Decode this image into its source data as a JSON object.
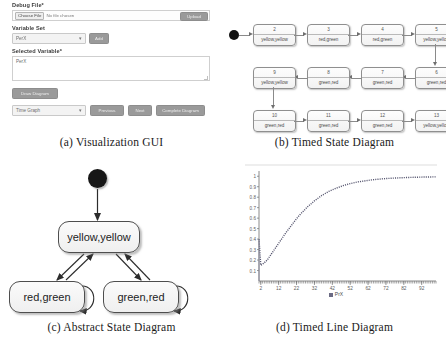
{
  "panel_a": {
    "caption": "(a) Visualization GUI",
    "debug_file": {
      "label": "Debug File*",
      "choose_button": "Choose File",
      "file_status": "No file chosen",
      "upload_button": "Upload"
    },
    "variable_set": {
      "label": "Variable Set",
      "selected_option": "PerX",
      "add_button": "Add"
    },
    "selected_variable": {
      "label": "Selected Variable*",
      "value": "PerX"
    },
    "draw_button": "Draw Diagram",
    "footer": {
      "diagram_type": "Time Graph",
      "previous_button": "Previous",
      "next_button": "Next",
      "complete_button": "Complete Diagram"
    }
  },
  "panel_b": {
    "caption": "(b) Timed State Diagram",
    "initial_node": "initial-state",
    "states": [
      {
        "id": "2",
        "label": "yellow,yellow"
      },
      {
        "id": "3",
        "label": "red,green"
      },
      {
        "id": "4",
        "label": "red,green"
      },
      {
        "id": "5",
        "label": "yellow,yellow"
      },
      {
        "id": "9",
        "label": "yellow,yellow"
      },
      {
        "id": "8",
        "label": "green,red"
      },
      {
        "id": "7",
        "label": "green,red"
      },
      {
        "id": "6",
        "label": "green,red"
      },
      {
        "id": "10",
        "label": "green,red"
      },
      {
        "id": "11",
        "label": "green,red"
      },
      {
        "id": "12",
        "label": "green,red"
      },
      {
        "id": "13",
        "label": "yellow,yellow"
      }
    ]
  },
  "panel_c": {
    "caption": "(c) Abstract State Diagram",
    "initial_node": "initial-state",
    "states": [
      {
        "label": "yellow,yellow"
      },
      {
        "label": "red,green"
      },
      {
        "label": "green,red"
      }
    ]
  },
  "panel_d": {
    "caption": "(d) Timed Line Diagram",
    "chart_data": {
      "type": "line",
      "title": "",
      "xlabel": "",
      "ylabel": "",
      "legend": [
        "PrX"
      ],
      "legend_position": "bottom",
      "grid": false,
      "xlim": [
        1,
        100
      ],
      "ylim": [
        0,
        1.05
      ],
      "yticks": [
        "0.1",
        "0.2",
        "0.3",
        "0.4",
        "0.5",
        "0.6",
        "0.7",
        "0.8",
        "0.9",
        "1"
      ],
      "xticks": [
        "2",
        "12",
        "22",
        "32",
        "42",
        "52",
        "62",
        "72",
        "82",
        "92"
      ],
      "series": [
        {
          "name": "PrX",
          "x": [
            1,
            2,
            3,
            4,
            5,
            6,
            7,
            8,
            9,
            10,
            12,
            14,
            16,
            18,
            20,
            22,
            24,
            26,
            28,
            30,
            32,
            34,
            36,
            38,
            40,
            44,
            48,
            52,
            56,
            60,
            64,
            68,
            72,
            76,
            80,
            84,
            88,
            92,
            96,
            100
          ],
          "y": [
            0.4,
            0.15,
            0.16,
            0.175,
            0.19,
            0.21,
            0.235,
            0.26,
            0.285,
            0.31,
            0.36,
            0.41,
            0.46,
            0.505,
            0.55,
            0.595,
            0.635,
            0.67,
            0.705,
            0.735,
            0.765,
            0.79,
            0.815,
            0.835,
            0.855,
            0.885,
            0.91,
            0.93,
            0.945,
            0.955,
            0.965,
            0.972,
            0.978,
            0.982,
            0.985,
            0.988,
            0.99,
            0.992,
            0.993,
            0.994
          ]
        }
      ]
    }
  }
}
